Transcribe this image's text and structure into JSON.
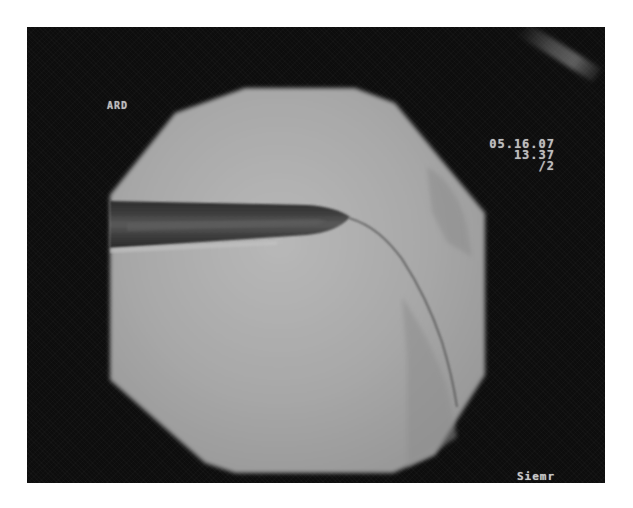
{
  "image": {
    "type": "fluoroscopy-frame",
    "description": "Grayscale fluoroscopic image within an octagonal field of view showing a dark tubular catheter/sheath entering from the left with a thin guidewire curving downward to the right",
    "colors": {
      "page_background": "#ffffff",
      "frame_background": "#0d0d0d",
      "field_of_view": "#a9a9a9",
      "field_highlight": "#b8b8b8",
      "sheath_dark": "#3a3a3a",
      "sheath_core": "#555555",
      "overlay_text": "#bdbdbd"
    }
  },
  "overlay": {
    "top_left_label": "ARD",
    "top_right": {
      "date": "05.16.07",
      "time": "13.37",
      "frame": "/2"
    },
    "bottom_right_label": "Siemr"
  }
}
